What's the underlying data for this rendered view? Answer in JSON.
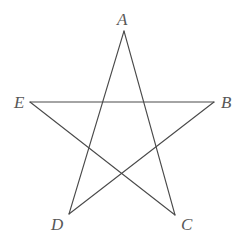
{
  "figure": {
    "name": "pentagram-diagram",
    "background_color": "#ffffff",
    "stroke_color": "#4a4a4a",
    "stroke_width": 1.1,
    "label_color": "#575757",
    "canvas": {
      "width": 240,
      "height": 243
    }
  },
  "labels": {
    "a": "A",
    "b": "B",
    "c": "C",
    "d": "D",
    "e": "E"
  },
  "chart_data": {
    "type": "scatter",
    "title": "",
    "xlabel": "",
    "ylabel": "",
    "grid": false,
    "legend": null,
    "xlim": [
      0,
      240
    ],
    "ylim": [
      0,
      243
    ],
    "points": [
      {
        "label": "A",
        "x": 124,
        "y": 31
      },
      {
        "label": "B",
        "x": 214,
        "y": 102
      },
      {
        "label": "C",
        "x": 175,
        "y": 215
      },
      {
        "label": "D",
        "x": 69,
        "y": 214
      },
      {
        "label": "E",
        "x": 30,
        "y": 102
      }
    ],
    "edges": [
      {
        "from": "A",
        "to": "C"
      },
      {
        "from": "C",
        "to": "E"
      },
      {
        "from": "E",
        "to": "B"
      },
      {
        "from": "B",
        "to": "D"
      },
      {
        "from": "D",
        "to": "A"
      }
    ],
    "path": "A,C,E,B,D,A"
  }
}
